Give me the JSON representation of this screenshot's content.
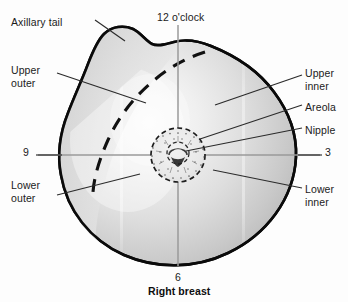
{
  "figure": {
    "caption": "Right breast"
  },
  "labels": {
    "axillary_tail": "Axillary tail",
    "upper_outer": "Upper\nouter",
    "lower_outer": "Lower\nouter",
    "upper_inner": "Upper\ninner",
    "lower_inner": "Lower\ninner",
    "areola": "Areola",
    "nipple": "Nipple"
  },
  "clock": {
    "twelve": "12 o'clock",
    "three": "3",
    "six": "6",
    "nine": "9"
  },
  "colors": {
    "outline": "#0a0a0a",
    "fill_light": "#f2f2f2",
    "fill_mid": "#d6d6d6",
    "fill_dark": "#b4b4b4",
    "leader_line": "#2b2b2b",
    "crosshair": "#9a9a9a",
    "text": "#1b1b1b",
    "background": "#fdfdfd"
  },
  "geometry": {
    "center_x": 178,
    "center_y": 155,
    "breast_radius": 118,
    "areola_radius": 27,
    "nipple_radius": 11
  }
}
